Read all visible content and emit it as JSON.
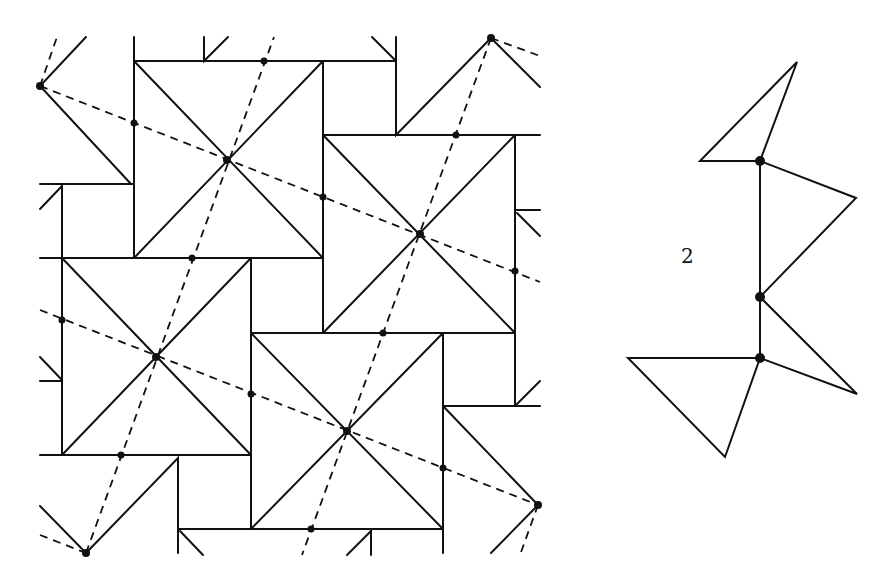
{
  "figure": {
    "label": "2",
    "stroke_color": "#111111",
    "background": "#ffffff"
  },
  "tiling": {
    "description": "Pinwheel-like tiling of squares with diagonals, dashed lines through square centers",
    "square_centers": [
      [
        227,
        160
      ],
      [
        420,
        234
      ],
      [
        156,
        357
      ],
      [
        347,
        431
      ]
    ],
    "lattice_points": [
      [
        40,
        86
      ],
      [
        491,
        38
      ],
      [
        86,
        553
      ],
      [
        538,
        505
      ]
    ]
  },
  "motif": {
    "description": "Fundamental region: vertical segment with three marked points and attached triangles",
    "marked_points": [
      [
        760,
        161
      ],
      [
        760,
        297
      ],
      [
        760,
        358
      ]
    ]
  }
}
